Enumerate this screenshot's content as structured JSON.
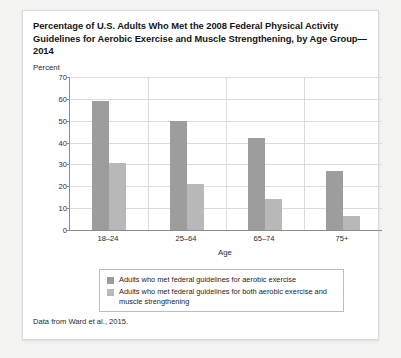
{
  "card": {
    "title": "Percentage of U.S. Adults Who Met the 2008 Federal Physical Activity Guidelines for Aerobic Exercise and Muscle Strengthening, by Age Group—2014",
    "source": "Data from Ward et al., 2015."
  },
  "legend": {
    "items": [
      {
        "label": "Adults who met federal guidelines for aerobic exercise",
        "color": "#9d9d9d"
      },
      {
        "label": "Adults who met federal guidelines for both aerobic exercise and muscle strengthening",
        "color": "#b8b8b8"
      }
    ]
  },
  "chart_data": {
    "type": "bar",
    "title": "Percentage of U.S. Adults Who Met the 2008 Federal Physical Activity Guidelines for Aerobic Exercise and Muscle Strengthening, by Age Group—2014",
    "xlabel": "Age",
    "ylabel": "Percent",
    "ylim": [
      0,
      70
    ],
    "yticks": [
      0,
      10,
      20,
      30,
      40,
      50,
      60,
      70
    ],
    "grid": true,
    "legend_position": "bottom",
    "categories": [
      "18–24",
      "25–64",
      "65–74",
      "75+"
    ],
    "series": [
      {
        "name": "Adults who met federal guidelines for aerobic exercise",
        "color": "#9d9d9d",
        "values": [
          59,
          50,
          42,
          27
        ]
      },
      {
        "name": "Adults who met federal guidelines for both aerobic exercise and muscle strengthening",
        "color": "#b8b8b8",
        "values": [
          30.5,
          21,
          14,
          6.5
        ]
      }
    ]
  }
}
